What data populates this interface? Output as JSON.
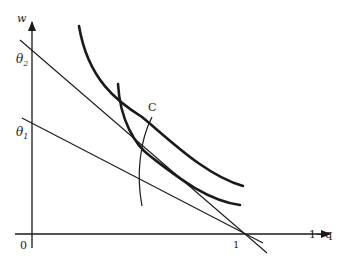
{
  "diagram": {
    "type": "economics-indifference-diagram",
    "axes": {
      "y_label": "w",
      "x_label": "1−q",
      "origin_label": "0",
      "x_tick_label": "1"
    },
    "intercepts": {
      "theta1": {
        "base": "θ",
        "sub": "1"
      },
      "theta2": {
        "base": "θ",
        "sub": "2"
      }
    },
    "curve_label": "C",
    "colors": {
      "ink": "#1a1a1a",
      "background": "#ffffff"
    }
  }
}
